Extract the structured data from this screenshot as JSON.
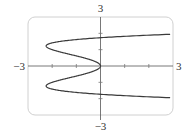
{
  "chart_data": {
    "type": "line",
    "title": "",
    "xlabel": "",
    "ylabel": "",
    "xlim": [
      -3,
      3
    ],
    "ylim": [
      -3,
      3
    ],
    "grid": false,
    "tick_labels": {
      "x_min": "−3",
      "x_max": "3",
      "y_min": "−3",
      "y_max": "3"
    },
    "x_ticks": [
      -2,
      -1,
      1,
      2
    ],
    "y_ticks": [
      -2,
      -1,
      1,
      2
    ],
    "series": [
      {
        "name": "x = y^4 - 3y^2",
        "parametric": "x = y^4 - 3y^2",
        "points": [
          {
            "x": 3.0,
            "y": 1.95
          },
          {
            "x": 0.0,
            "y": 1.73
          },
          {
            "x": -2.25,
            "y": 1.22
          },
          {
            "x": -1.0,
            "y": 0.6
          },
          {
            "x": 0.0,
            "y": 0.0
          },
          {
            "x": -1.0,
            "y": -0.6
          },
          {
            "x": -2.25,
            "y": -1.22
          },
          {
            "x": 0.0,
            "y": -1.73
          },
          {
            "x": 3.0,
            "y": -1.95
          }
        ]
      }
    ],
    "colors": {
      "curve": "#3a3a3a",
      "axes": "#555555",
      "frame": "#cfcfcf"
    }
  }
}
